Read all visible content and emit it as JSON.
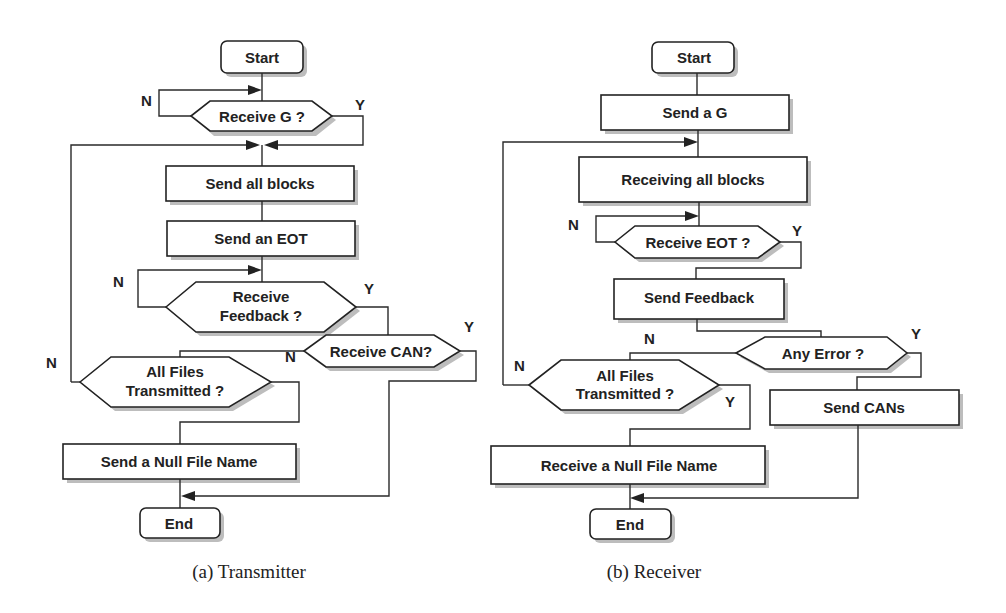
{
  "transmitter": {
    "caption": "(a) Transmitter",
    "start": "Start",
    "receive_g": "Receive G ?",
    "send_all_blocks": "Send all blocks",
    "send_eot": "Send an EOT",
    "receive_feedback_1": "Receive",
    "receive_feedback_2": "Feedback ?",
    "receive_can": "Receive CAN?",
    "all_files_1": "All Files",
    "all_files_2": "Transmitted ?",
    "send_null": "Send a Null File Name",
    "end": "End",
    "yes": "Y",
    "no": "N"
  },
  "receiver": {
    "caption": "(b) Receiver",
    "start": "Start",
    "send_g": "Send a G",
    "receiving_all_blocks": "Receiving all blocks",
    "receive_eot": "Receive EOT ?",
    "send_feedback": "Send Feedback",
    "any_error": "Any Error ?",
    "all_files_1": "All Files",
    "all_files_2": "Transmitted ?",
    "send_cans": "Send CANs",
    "receive_null": "Receive a Null File Name",
    "end": "End",
    "yes": "Y",
    "no": "N"
  }
}
